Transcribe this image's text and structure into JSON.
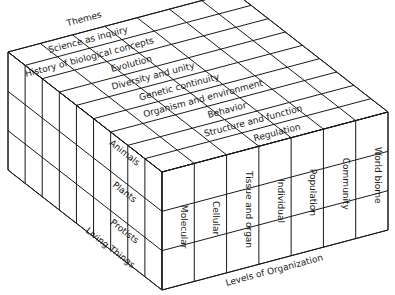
{
  "diagram": {
    "type": "3d-block-matrix",
    "axes": {
      "themes": {
        "title": "Themes",
        "items": [
          "Science as inquiry",
          "History of biological concepts",
          "Evolution",
          "Diversity and unity",
          "Genetic continuity",
          "Organism and environment",
          "Behavior",
          "Structure and function",
          "Regulation"
        ]
      },
      "levels": {
        "title": "Levels of Organization",
        "items": [
          "Molecular",
          "Cellular",
          "Tissue and organ",
          "Individual",
          "Population",
          "Community",
          "World biome"
        ]
      },
      "living_things": {
        "title": "Living Things",
        "items": [
          "Animals",
          "Plants",
          "Protists"
        ]
      }
    },
    "colors": {
      "line": "#1a1a1a",
      "background": "#ffffff"
    }
  }
}
